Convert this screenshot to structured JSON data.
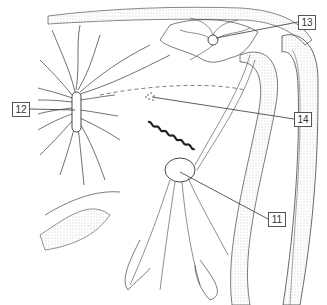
{
  "figure": {
    "type": "anatomical line drawing",
    "labels": [
      {
        "id": "12",
        "text": "12",
        "x": 12,
        "y": 102
      },
      {
        "id": "13",
        "text": "13",
        "x": 298,
        "y": 15
      },
      {
        "id": "14",
        "text": "14",
        "x": 294,
        "y": 112
      },
      {
        "id": "11",
        "text": "11",
        "x": 268,
        "y": 212
      }
    ]
  },
  "colors": {
    "line": "#333333",
    "stipple": "#9a9a9a",
    "background": "#ffffff"
  }
}
